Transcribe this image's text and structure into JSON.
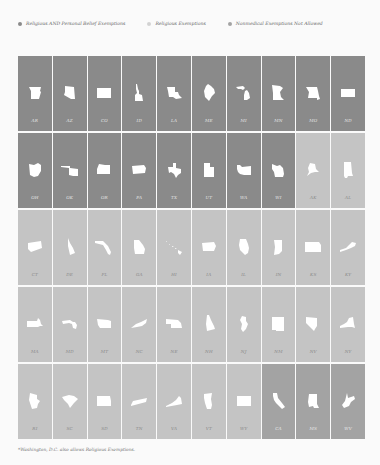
{
  "chart_data": {
    "type": "table",
    "title": "",
    "legend": [
      {
        "key": "a",
        "label": "Religious AND Personal Belief Exemptions",
        "color": "#8a8a8a"
      },
      {
        "key": "b",
        "label": "Religious Exemptions",
        "color": "#c4c4c4"
      },
      {
        "key": "c",
        "label": "Nonmedical Exemptions Not Allowed",
        "color": "#a3a3a3"
      }
    ],
    "layout": {
      "rows": 5,
      "columns": 10,
      "legend_position": "top"
    },
    "states": [
      {
        "abbr": "AR",
        "category": "a",
        "shape": "ar"
      },
      {
        "abbr": "AZ",
        "category": "a",
        "shape": "az"
      },
      {
        "abbr": "CO",
        "category": "a",
        "shape": "co"
      },
      {
        "abbr": "ID",
        "category": "a",
        "shape": "id"
      },
      {
        "abbr": "LA",
        "category": "a",
        "shape": "la"
      },
      {
        "abbr": "ME",
        "category": "a",
        "shape": "me"
      },
      {
        "abbr": "MI",
        "category": "a",
        "shape": "mi"
      },
      {
        "abbr": "MN",
        "category": "a",
        "shape": "mn"
      },
      {
        "abbr": "MO",
        "category": "a",
        "shape": "mo"
      },
      {
        "abbr": "ND",
        "category": "a",
        "shape": "nd"
      },
      {
        "abbr": "OH",
        "category": "a",
        "shape": "oh"
      },
      {
        "abbr": "OK",
        "category": "a",
        "shape": "ok"
      },
      {
        "abbr": "OR",
        "category": "a",
        "shape": "or"
      },
      {
        "abbr": "PA",
        "category": "a",
        "shape": "pa"
      },
      {
        "abbr": "TX",
        "category": "a",
        "shape": "tx"
      },
      {
        "abbr": "UT",
        "category": "a",
        "shape": "ut"
      },
      {
        "abbr": "WA",
        "category": "a",
        "shape": "wa"
      },
      {
        "abbr": "WI",
        "category": "a",
        "shape": "wi"
      },
      {
        "abbr": "AK",
        "category": "b",
        "shape": "ak"
      },
      {
        "abbr": "AL",
        "category": "b",
        "shape": "al"
      },
      {
        "abbr": "CT",
        "category": "b",
        "shape": "ct"
      },
      {
        "abbr": "DE",
        "category": "b",
        "shape": "de"
      },
      {
        "abbr": "FL",
        "category": "b",
        "shape": "fl"
      },
      {
        "abbr": "GA",
        "category": "b",
        "shape": "ga"
      },
      {
        "abbr": "HI",
        "category": "b",
        "shape": "hi"
      },
      {
        "abbr": "IA",
        "category": "b",
        "shape": "ia"
      },
      {
        "abbr": "IL",
        "category": "b",
        "shape": "il"
      },
      {
        "abbr": "IN",
        "category": "b",
        "shape": "in"
      },
      {
        "abbr": "KS",
        "category": "b",
        "shape": "ks"
      },
      {
        "abbr": "KY",
        "category": "b",
        "shape": "ky"
      },
      {
        "abbr": "MA",
        "category": "b",
        "shape": "ma"
      },
      {
        "abbr": "MD",
        "category": "b",
        "shape": "md"
      },
      {
        "abbr": "MT",
        "category": "b",
        "shape": "mt"
      },
      {
        "abbr": "NC",
        "category": "b",
        "shape": "nc"
      },
      {
        "abbr": "NE",
        "category": "b",
        "shape": "ne"
      },
      {
        "abbr": "NH",
        "category": "b",
        "shape": "nh"
      },
      {
        "abbr": "NJ",
        "category": "b",
        "shape": "nj"
      },
      {
        "abbr": "NM",
        "category": "b",
        "shape": "nm"
      },
      {
        "abbr": "NV",
        "category": "b",
        "shape": "nv"
      },
      {
        "abbr": "NY",
        "category": "b",
        "shape": "ny"
      },
      {
        "abbr": "RI",
        "category": "b",
        "shape": "ri"
      },
      {
        "abbr": "SC",
        "category": "b",
        "shape": "sc"
      },
      {
        "abbr": "SD",
        "category": "b",
        "shape": "sd"
      },
      {
        "abbr": "TN",
        "category": "b",
        "shape": "tn"
      },
      {
        "abbr": "VA",
        "category": "b",
        "shape": "va"
      },
      {
        "abbr": "VT",
        "category": "b",
        "shape": "vt"
      },
      {
        "abbr": "WY",
        "category": "b",
        "shape": "wy"
      },
      {
        "abbr": "CA",
        "category": "c",
        "shape": "ca"
      },
      {
        "abbr": "MS",
        "category": "c",
        "shape": "ms"
      },
      {
        "abbr": "WV",
        "category": "c",
        "shape": "wv"
      }
    ],
    "counts": {
      "a": 18,
      "b": 29,
      "c": 3
    }
  },
  "footnote": "*Washington, D.C. also allows Religious Exemptions."
}
